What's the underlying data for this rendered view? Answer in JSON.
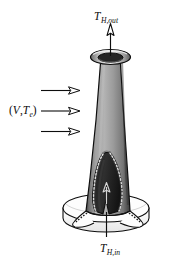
{
  "figure": {
    "title_visible": false,
    "background_color": "#ffffff",
    "labels": {
      "outlet": {
        "symbol": "T",
        "subscript": "H,out",
        "full_text": "T_H,out",
        "position": "top"
      },
      "inlet": {
        "symbol": "T",
        "subscript": "H,in",
        "full_text": "T_H,in",
        "position": "bottom"
      },
      "crossflow": {
        "full_text": "(V,Te)",
        "open_paren": "(",
        "velocity_symbol": "V",
        "comma": ",",
        "temperature_symbol": "T",
        "temperature_subscript": "e",
        "close_paren": ")",
        "position": "left"
      }
    },
    "arrows": {
      "crossflow_count": 3,
      "crossflow_direction": "right",
      "outlet_direction": "up",
      "inlet_direction": "up",
      "interior_direction": "up"
    },
    "colors": {
      "body_light": "#b4b4b4",
      "body_mid": "#8f8f8f",
      "body_dark": "#4a4a4a",
      "cavity_dark": "#2a2a2a",
      "outline": "#111111",
      "base_fill": "#fdfdfd",
      "rim_fill": "#d8d8d8",
      "stroke": "#0d0d0d"
    },
    "geometry": {
      "shape": "tapered-conical-shell",
      "base": "circular-disc",
      "cutaway": "front-sectioned-cavity"
    }
  }
}
